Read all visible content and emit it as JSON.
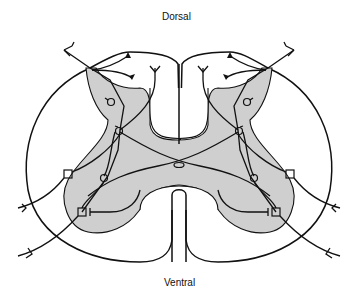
{
  "diagram": {
    "labels": {
      "top": "Dorsal",
      "bottom": "Ventral"
    },
    "regions": [
      "white-matter-outline",
      "grey-matter-butterfly",
      "central-canal",
      "dorsal-median-septum",
      "ventral-median-fissure"
    ],
    "neuron_symbols": {
      "circle": "interneuron",
      "square": "motor-neuron"
    },
    "colors": {
      "grey_matter": "#cfcfcf",
      "line": "#111111",
      "background": "#ffffff"
    }
  }
}
